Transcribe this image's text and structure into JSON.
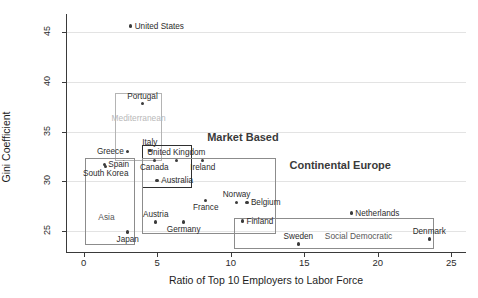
{
  "chart_data": {
    "type": "scatter",
    "title": "",
    "xlabel": "Ratio of Top 10 Employers to Labor Force",
    "ylabel": "Gini Coefficient",
    "xlim": [
      -1.2,
      26.0
    ],
    "ylim": [
      22.8,
      46.8
    ],
    "xticks": [
      0,
      5,
      10,
      15,
      20,
      25
    ],
    "yticks": [
      25,
      30,
      35,
      40,
      45
    ],
    "grid": "horizontal",
    "legend": "none",
    "points": [
      {
        "label": "United States",
        "x": 3.2,
        "y": 45.6,
        "label_pos": "right"
      },
      {
        "label": "Portugal",
        "x": 4.0,
        "y": 37.8,
        "label_pos": "above"
      },
      {
        "label": "Greece",
        "x": 3.0,
        "y": 33.0,
        "label_pos": "left"
      },
      {
        "label": "Spain",
        "x": 1.4,
        "y": 31.7,
        "label_pos": "right"
      },
      {
        "label": "Italy",
        "x": 4.5,
        "y": 33.1,
        "label_pos": "above"
      },
      {
        "label": "Canada",
        "x": 4.8,
        "y": 32.1,
        "label_pos": "below"
      },
      {
        "label": "United Kingdom",
        "x": 6.3,
        "y": 32.1,
        "label_pos": "above"
      },
      {
        "label": "Ireland",
        "x": 8.1,
        "y": 32.1,
        "label_pos": "below"
      },
      {
        "label": "Australia",
        "x": 5.0,
        "y": 30.1,
        "label_pos": "right"
      },
      {
        "label": "South Korea",
        "x": 1.5,
        "y": 31.5,
        "label_pos": "below"
      },
      {
        "label": "Japan",
        "x": 3.0,
        "y": 24.9,
        "label_pos": "below"
      },
      {
        "label": "Austria",
        "x": 4.9,
        "y": 25.9,
        "label_pos": "above"
      },
      {
        "label": "Germany",
        "x": 6.8,
        "y": 25.9,
        "label_pos": "below"
      },
      {
        "label": "France",
        "x": 8.3,
        "y": 28.1,
        "label_pos": "below"
      },
      {
        "label": "Norway",
        "x": 10.4,
        "y": 27.9,
        "label_pos": "above"
      },
      {
        "label": "Belgium",
        "x": 11.1,
        "y": 27.9,
        "label_pos": "right"
      },
      {
        "label": "Finland",
        "x": 10.8,
        "y": 26.0,
        "label_pos": "right"
      },
      {
        "label": "Sweden",
        "x": 14.6,
        "y": 23.7,
        "label_pos": "above"
      },
      {
        "label": "Netherlands",
        "x": 18.2,
        "y": 26.8,
        "label_pos": "right"
      },
      {
        "label": "Denmark",
        "x": 23.5,
        "y": 24.2,
        "label_pos": "above"
      }
    ],
    "groups": [
      {
        "name": "Mediterranean",
        "style": "light",
        "x0": 2.1,
        "x1": 5.3,
        "y0": 38.9,
        "y1": 32.0,
        "label_x": 1.9,
        "label_y": 36.9,
        "label_style": "faded",
        "label_size": "small"
      },
      {
        "name": "Market Based",
        "style": "thick",
        "x0": 4.0,
        "x1": 7.4,
        "y0": 33.6,
        "y1": 29.3,
        "label_x": 8.4,
        "label_y": 35.1,
        "label_style": "dark",
        "label_size": "big"
      },
      {
        "name": "Asia",
        "style": "normal",
        "x0": 0.1,
        "x1": 3.5,
        "y0": 32.3,
        "y1": 23.6,
        "label_x": 1.0,
        "label_y": 26.9,
        "label_style": "plain",
        "label_size": "small"
      },
      {
        "name": "Continental Europe",
        "style": "normal",
        "x0": 4.0,
        "x1": 13.1,
        "y0": 32.3,
        "y1": 24.7,
        "label_x": 14.0,
        "label_y": 32.2,
        "label_style": "dark",
        "label_size": "big"
      },
      {
        "name": "Social Democratic",
        "style": "normal",
        "x0": 10.2,
        "x1": 23.8,
        "y0": 26.3,
        "y1": 23.2,
        "label_x": 16.4,
        "label_y": 25.0,
        "label_style": "plain",
        "label_size": "small"
      }
    ]
  }
}
